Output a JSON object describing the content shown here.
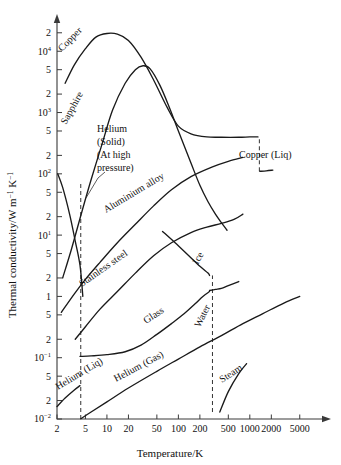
{
  "chart_data": {
    "type": "line",
    "title": "",
    "xlabel": "Temperature/K",
    "ylabel": "Thermal conductivity/W m⁻¹ K⁻¹",
    "xscale": "log",
    "yscale": "log",
    "xlim": [
      2,
      9000
    ],
    "ylim": [
      0.01,
      30000
    ],
    "grid": false,
    "legend_position": "inline-curve-labels",
    "xticks": [
      {
        "value": 2,
        "label": "2"
      },
      {
        "value": 5,
        "label": "5"
      },
      {
        "value": 10,
        "label": "10"
      },
      {
        "value": 20,
        "label": "20"
      },
      {
        "value": 50,
        "label": "50"
      },
      {
        "value": 100,
        "label": "100"
      },
      {
        "value": 200,
        "label": "200"
      },
      {
        "value": 500,
        "label": "500"
      },
      {
        "value": 1000,
        "label": "1000"
      },
      {
        "value": 2000,
        "label": "2000"
      },
      {
        "value": 5000,
        "label": "5000"
      }
    ],
    "yticks": [
      {
        "value": 0.01,
        "label": "10",
        "exp": "-2"
      },
      {
        "value": 0.02,
        "label": "2",
        "exp": ""
      },
      {
        "value": 0.05,
        "label": "5",
        "exp": ""
      },
      {
        "value": 0.1,
        "label": "10",
        "exp": "-1"
      },
      {
        "value": 0.2,
        "label": "2",
        "exp": ""
      },
      {
        "value": 0.5,
        "label": "5",
        "exp": ""
      },
      {
        "value": 1,
        "label": "1",
        "exp": ""
      },
      {
        "value": 2,
        "label": "2",
        "exp": ""
      },
      {
        "value": 5,
        "label": "5",
        "exp": ""
      },
      {
        "value": 10,
        "label": "10",
        "exp": "1"
      },
      {
        "value": 20,
        "label": "2",
        "exp": ""
      },
      {
        "value": 50,
        "label": "5",
        "exp": ""
      },
      {
        "value": 100,
        "label": "10",
        "exp": "2"
      },
      {
        "value": 200,
        "label": "2",
        "exp": ""
      },
      {
        "value": 500,
        "label": "5",
        "exp": ""
      },
      {
        "value": 1000,
        "label": "10",
        "exp": "3"
      },
      {
        "value": 2000,
        "label": "2",
        "exp": ""
      },
      {
        "value": 5000,
        "label": "5",
        "exp": ""
      },
      {
        "value": 10000,
        "label": "10",
        "exp": "4"
      },
      {
        "value": 20000,
        "label": "2",
        "exp": ""
      }
    ],
    "series": [
      {
        "name": "Copper",
        "label": "Copper",
        "points": [
          [
            2.6,
            3000
          ],
          [
            3.5,
            6000
          ],
          [
            5,
            11000
          ],
          [
            7,
            17000
          ],
          [
            10,
            19500
          ],
          [
            14,
            19000
          ],
          [
            20,
            15000
          ],
          [
            30,
            8000
          ],
          [
            45,
            3400
          ],
          [
            70,
            1200
          ],
          [
            100,
            600
          ],
          [
            150,
            450
          ],
          [
            250,
            400
          ],
          [
            400,
            395
          ],
          [
            700,
            395
          ],
          [
            1000,
            400
          ],
          [
            1300,
            400
          ]
        ]
      },
      {
        "name": "Copper (Liq)",
        "label": "Copper (Liq)",
        "points": [
          [
            1380,
            110
          ],
          [
            1700,
            112
          ],
          [
            2100,
            115
          ]
        ],
        "connector": "dashed-drop"
      },
      {
        "name": "Sapphire",
        "label": "Sapphire",
        "points": [
          [
            2.4,
            2.0
          ],
          [
            3.2,
            6
          ],
          [
            4.5,
            25
          ],
          [
            6,
            80
          ],
          [
            8.5,
            300
          ],
          [
            12,
            1100
          ],
          [
            18,
            3000
          ],
          [
            25,
            5000
          ],
          [
            32,
            5800
          ],
          [
            40,
            5200
          ],
          [
            55,
            2800
          ],
          [
            75,
            1200
          ],
          [
            100,
            500
          ],
          [
            150,
            150
          ],
          [
            200,
            65
          ],
          [
            260,
            35
          ],
          [
            330,
            22
          ],
          [
            400,
            16
          ],
          [
            480,
            12
          ]
        ]
      },
      {
        "name": "Helium (Solid) (At high pressure)",
        "label": "Helium\n(Solid)\n(At high\npressure)",
        "points": [
          [
            2.05,
            100
          ],
          [
            2.4,
            60
          ],
          [
            3.0,
            22
          ],
          [
            3.6,
            8
          ],
          [
            4.2,
            3.2
          ],
          [
            4.6,
            1.0
          ]
        ],
        "annotation": true
      },
      {
        "name": "Aluminium alloy",
        "label": "Aluminium alloy",
        "points": [
          [
            2.3,
            0.55
          ],
          [
            3.5,
            1.1
          ],
          [
            5,
            1.9
          ],
          [
            8,
            3.6
          ],
          [
            14,
            7.5
          ],
          [
            25,
            15
          ],
          [
            45,
            30
          ],
          [
            80,
            55
          ],
          [
            150,
            90
          ],
          [
            300,
            130
          ],
          [
            500,
            160
          ],
          [
            800,
            185
          ]
        ]
      },
      {
        "name": "Stainless steel",
        "label": "Stainless steel",
        "points": [
          [
            3.6,
            0.2
          ],
          [
            5,
            0.32
          ],
          [
            8,
            0.62
          ],
          [
            14,
            1.2
          ],
          [
            25,
            2.4
          ],
          [
            45,
            4.6
          ],
          [
            80,
            7.5
          ],
          [
            150,
            11
          ],
          [
            250,
            13.5
          ],
          [
            400,
            15.5
          ],
          [
            600,
            18
          ],
          [
            800,
            22
          ]
        ]
      },
      {
        "name": "Ice",
        "label": "Ice",
        "points": [
          [
            60,
            11.5
          ],
          [
            90,
            7.5
          ],
          [
            140,
            4.6
          ],
          [
            200,
            3.1
          ],
          [
            260,
            2.4
          ],
          [
            273,
            2.2
          ]
        ],
        "connector": "drop-to-water"
      },
      {
        "name": "Glass",
        "label": "Glass",
        "points": [
          [
            4.2,
            0.105
          ],
          [
            6,
            0.107
          ],
          [
            10,
            0.112
          ],
          [
            18,
            0.125
          ],
          [
            30,
            0.16
          ],
          [
            50,
            0.24
          ],
          [
            80,
            0.36
          ],
          [
            120,
            0.52
          ],
          [
            170,
            0.75
          ],
          [
            220,
            1.0
          ],
          [
            273,
            1.2
          ]
        ]
      },
      {
        "name": "Water",
        "label": "Water",
        "points": [
          [
            273,
            1.25
          ],
          [
            330,
            1.3
          ],
          [
            400,
            1.35
          ],
          [
            500,
            1.5
          ],
          [
            700,
            1.75
          ]
        ]
      },
      {
        "name": "Helium (Liq)",
        "label": "Helium (Liq)",
        "points": [
          [
            2.0,
            0.016
          ],
          [
            2.6,
            0.022
          ],
          [
            3.4,
            0.029
          ],
          [
            4.2,
            0.035
          ]
        ]
      },
      {
        "name": "Helium (Gas)",
        "label": "Helium (Gas)",
        "points": [
          [
            4.3,
            0.0101
          ],
          [
            6,
            0.013
          ],
          [
            10,
            0.019
          ],
          [
            20,
            0.032
          ],
          [
            50,
            0.06
          ],
          [
            100,
            0.095
          ],
          [
            200,
            0.15
          ],
          [
            400,
            0.23
          ],
          [
            800,
            0.36
          ],
          [
            1500,
            0.52
          ],
          [
            3000,
            0.78
          ],
          [
            5000,
            1.0
          ]
        ]
      },
      {
        "name": "Steam",
        "label": "Steam",
        "points": [
          [
            380,
            0.013
          ],
          [
            500,
            0.028
          ],
          [
            700,
            0.055
          ],
          [
            900,
            0.08
          ]
        ],
        "connector": "dashed-drop"
      }
    ],
    "dashed_verticals": [
      {
        "x": 4.3,
        "from": 0.01,
        "to": 70,
        "note": "helium liquid/gas boundary"
      },
      {
        "x": 300,
        "from": 0.013,
        "to": 2.2,
        "note": "ice/water - steam boundary"
      },
      {
        "x": 1360,
        "from": 110,
        "to": 400,
        "note": "copper solid/liquid melting"
      }
    ]
  },
  "labels": {
    "copper": "Copper",
    "copper_liq": "Copper (Liq)",
    "sapphire": "Sapphire",
    "helium_solid_l1": "Helium",
    "helium_solid_l2": "(Solid)",
    "helium_solid_l3": "(At high",
    "helium_solid_l4": "pressure)",
    "aluminium_alloy": "Aluminium alloy",
    "stainless_steel": "Stainless steel",
    "ice": "Ice",
    "glass": "Glass",
    "water": "Water",
    "helium_liq": "Helium (Liq)",
    "helium_gas": "Helium (Gas)",
    "steam": "Steam",
    "x_axis_title": "Temperature/K",
    "y_axis_title_main": "Thermal conductivity/W m",
    "y_axis_sup_1": "−1",
    "y_axis_mid": " K",
    "y_axis_sup_2": "−1"
  },
  "xtick_text": [
    "2",
    "5",
    "10",
    "20",
    "50",
    "100",
    "200",
    "500",
    "1000",
    "2000",
    "5000"
  ],
  "ytick_text": [
    {
      "m": "10",
      "e": "−2"
    },
    {
      "m": "2",
      "e": ""
    },
    {
      "m": "5",
      "e": ""
    },
    {
      "m": "10",
      "e": "−1"
    },
    {
      "m": "2",
      "e": ""
    },
    {
      "m": "5",
      "e": ""
    },
    {
      "m": "1",
      "e": ""
    },
    {
      "m": "2",
      "e": ""
    },
    {
      "m": "5",
      "e": ""
    },
    {
      "m": "10",
      "e": "1"
    },
    {
      "m": "2",
      "e": ""
    },
    {
      "m": "5",
      "e": ""
    },
    {
      "m": "10",
      "e": "2"
    },
    {
      "m": "2",
      "e": ""
    },
    {
      "m": "5",
      "e": ""
    },
    {
      "m": "10",
      "e": "3"
    },
    {
      "m": "2",
      "e": ""
    },
    {
      "m": "5",
      "e": ""
    },
    {
      "m": "10",
      "e": "4"
    },
    {
      "m": "2",
      "e": ""
    }
  ],
  "colors": {
    "curve": "#1a1a1a",
    "axis": "#3a3a3a",
    "dashed": "#333333",
    "background": "#ffffff"
  }
}
